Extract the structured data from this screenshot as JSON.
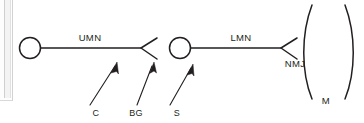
{
  "figure": {
    "background_color": "#ffffff",
    "ink_color": "#231f20",
    "page_edge_color": "#f3f3f3"
  },
  "labels": {
    "upper_motor_neuron": "UMN",
    "lower_motor_neuron": "LMN",
    "neuromuscular_junction": "NMJ",
    "muscle": "M",
    "cortex": "C",
    "basal_ganglia": "BG",
    "spinal_cord": "S"
  },
  "nodes": [
    {
      "id": "umn-soma",
      "name": "upper-motor-neuron-soma",
      "shape": "circle",
      "cx": 30,
      "cy": 48,
      "r": 10.5
    },
    {
      "id": "lmn-soma",
      "name": "lower-motor-neuron-soma",
      "shape": "circle",
      "cx": 180,
      "cy": 48,
      "r": 10.5
    }
  ],
  "axons": [
    {
      "id": "umn-axon",
      "label": "UMN",
      "label_x": 90,
      "label_y": 41,
      "path": "M 40.5 48 L 141 48",
      "terminal_path": "M 157 38 L 141 48 L 157 59"
    },
    {
      "id": "lmn-axon",
      "label": "LMN",
      "label_x": 241,
      "label_y": 41,
      "path": "M 190.5 48 L 281 48",
      "terminal_path": "M 297 38 L 281 48 L 297 59"
    }
  ],
  "nmj_label": {
    "text": "NMJ",
    "x": 295,
    "y": 67
  },
  "muscle": {
    "label": "M",
    "label_x": 326,
    "label_y": 104,
    "left_arc": "M 312 5 C 301 34, 301 72, 312 99",
    "right_arc": "M 345 5 C 356 34, 356 72, 345 99"
  },
  "annotations": [
    {
      "id": "annotation-c",
      "label": "C",
      "label_x": 96,
      "label_y": 115,
      "line": {
        "x1": 90,
        "y1": 105,
        "x2": 116,
        "y2": 65
      },
      "arrow_tip": {
        "x": 117,
        "y": 62
      }
    },
    {
      "id": "annotation-bg",
      "label": "BG",
      "label_x": 136,
      "label_y": 115,
      "line": {
        "x1": 137,
        "y1": 105,
        "x2": 153,
        "y2": 65
      },
      "arrow_tip": {
        "x": 154,
        "y": 62
      }
    },
    {
      "id": "annotation-s",
      "label": "S",
      "label_x": 177,
      "label_y": 115,
      "line": {
        "x1": 170,
        "y1": 105,
        "x2": 192,
        "y2": 67
      },
      "arrow_tip": {
        "x": 193,
        "y": 64
      }
    }
  ]
}
